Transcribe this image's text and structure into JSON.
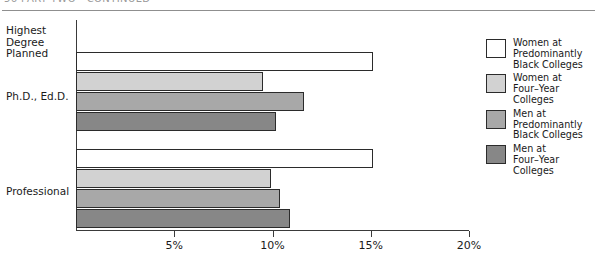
{
  "header": {
    "text": "56    PART TWO  ·  CONTINUED"
  },
  "chart_data": {
    "type": "bar",
    "orientation": "horizontal",
    "title": "",
    "xlabel": "",
    "ylabel": "Highest Degree Planned",
    "categories": [
      "Ph.D., Ed.D.",
      "Professional"
    ],
    "xlim": [
      0,
      20
    ],
    "xticks": [
      5,
      10,
      15,
      20
    ],
    "xticklabels": [
      "5%",
      "10%",
      "15%",
      "20%"
    ],
    "grid": false,
    "legend_position": "right",
    "series": [
      {
        "name": "Women at\nPredominantly\nBlack Colleges",
        "color": "#ffffff",
        "values": [
          15.1,
          15.1
        ]
      },
      {
        "name": "Women at\nFour–Year\nColleges",
        "color": "#d2d2d2",
        "values": [
          9.5,
          9.9
        ]
      },
      {
        "name": "Men at\nPredominantly\nBlack Colleges",
        "color": "#a8a8a8",
        "values": [
          11.6,
          10.4
        ]
      },
      {
        "name": "Men at\nFour–Year\nColleges",
        "color": "#878787",
        "values": [
          10.2,
          10.9
        ]
      }
    ]
  },
  "axis_title": "Highest\nDegree\nPlanned"
}
